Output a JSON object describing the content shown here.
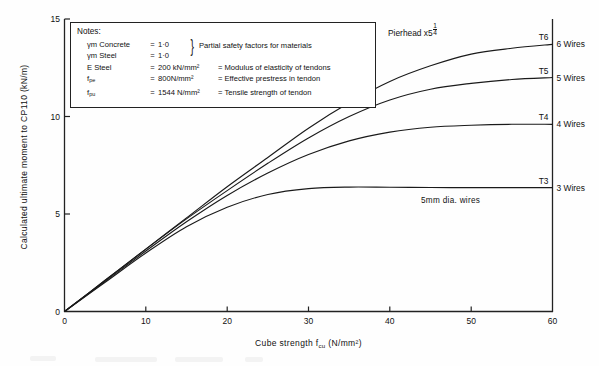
{
  "figure": {
    "pierhead_label": "Pierhead x5¼",
    "annotation_wires": "5mm dia. wires"
  },
  "notes": {
    "heading": "Notes:",
    "brace_text": "Partial safety factors for materials",
    "rows": [
      {
        "symbol": "γm Concrete",
        "eq": "=",
        "value": "1·0",
        "desc": ""
      },
      {
        "symbol": "γm Steel",
        "eq": "=",
        "value": "1·0",
        "desc": ""
      },
      {
        "symbol": "E Steel",
        "eq": "=",
        "value": "200 kN/mm²",
        "desc": "= Modulus of elasticity of tendons"
      },
      {
        "symbol": "f pe",
        "eq": "=",
        "value": "800N/mm²",
        "desc": "= Effective prestress in tendon"
      },
      {
        "symbol": "f pu",
        "eq": "=",
        "value": "1544 N/mm²",
        "desc": "= Tensile strength of tendon"
      }
    ]
  },
  "chart_data": {
    "type": "line",
    "xlabel": "Cube strength f_cu (N/mm²)",
    "ylabel": "Calculated ultimate moment to CP110 (kN/m)",
    "xlim": [
      0,
      60
    ],
    "ylim": [
      0,
      15
    ],
    "xticks": [
      0,
      10,
      20,
      30,
      40,
      50,
      60
    ],
    "yticks": [
      0,
      5,
      10,
      15
    ],
    "grid": false,
    "legend_position": "right-of-axis (end-of-curve labels)",
    "annotations": [
      "5mm dia. wires"
    ],
    "series": [
      {
        "name": "T6",
        "label": "T6",
        "wires_label": "6 Wires",
        "x": [
          0,
          5,
          10,
          15,
          20,
          25,
          30,
          35,
          40,
          45,
          50,
          55,
          60
        ],
        "y": [
          0,
          1.6,
          3.2,
          4.8,
          6.4,
          7.9,
          9.4,
          10.7,
          11.8,
          12.6,
          13.2,
          13.5,
          13.7
        ]
      },
      {
        "name": "T5",
        "label": "T5",
        "wires_label": "5 Wires",
        "x": [
          0,
          5,
          10,
          15,
          20,
          25,
          30,
          35,
          40,
          45,
          50,
          55,
          60
        ],
        "y": [
          0,
          1.6,
          3.2,
          4.75,
          6.2,
          7.6,
          8.9,
          10.0,
          10.85,
          11.4,
          11.7,
          11.9,
          12.0
        ]
      },
      {
        "name": "T4",
        "label": "T4",
        "wires_label": "4 Wires",
        "x": [
          0,
          5,
          10,
          15,
          20,
          25,
          30,
          35,
          40,
          45,
          50,
          55,
          60
        ],
        "y": [
          0,
          1.55,
          3.1,
          4.6,
          5.95,
          7.1,
          8.05,
          8.75,
          9.2,
          9.45,
          9.55,
          9.6,
          9.6
        ]
      },
      {
        "name": "T3",
        "label": "T3",
        "wires_label": "3 Wires",
        "x": [
          0,
          5,
          10,
          15,
          20,
          25,
          30,
          35,
          40,
          45,
          50,
          55,
          60
        ],
        "y": [
          0,
          1.5,
          3.0,
          4.35,
          5.35,
          6.0,
          6.3,
          6.38,
          6.37,
          6.36,
          6.35,
          6.35,
          6.35
        ]
      }
    ]
  },
  "axes": {
    "x_tick_labels": [
      "0",
      "10",
      "20",
      "30",
      "40",
      "50",
      "60"
    ],
    "y_tick_labels": [
      "0",
      "5",
      "10",
      "15"
    ],
    "x_title": "Cube strength f",
    "x_title_sub": "cu",
    "x_title_unit": "(N/mm²)",
    "y_title": "Calculated ultimate moment to CP110 (kN/m)"
  }
}
